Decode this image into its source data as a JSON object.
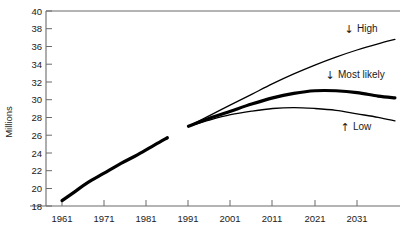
{
  "chart_data": {
    "type": "line",
    "title": "",
    "xlabel": "",
    "ylabel": "Millions",
    "xlim": [
      1961,
      2041
    ],
    "ylim": [
      18,
      40
    ],
    "ytick_step": 2,
    "grid": false,
    "legend_position": "inline-annotations",
    "xticks": [
      "1961",
      "1971",
      "1981",
      "1991",
      "2001",
      "2011",
      "2021",
      "2031"
    ],
    "yticks": [
      "18",
      "20",
      "22",
      "24",
      "26",
      "28",
      "30",
      "32",
      "34",
      "36",
      "38",
      "40"
    ],
    "series": [
      {
        "name": "Historical",
        "style": "thick",
        "annotation": "",
        "x": [
          1961,
          1964,
          1967,
          1971,
          1975,
          1979,
          1983,
          1986
        ],
        "values": [
          18.6,
          19.6,
          20.6,
          21.7,
          22.8,
          23.8,
          24.9,
          25.7
        ]
      },
      {
        "name": "High",
        "style": "thin",
        "annotation": "High",
        "annotation_arrow": "down-arrow",
        "x": [
          1991,
          1996,
          2001,
          2006,
          2011,
          2016,
          2021,
          2026,
          2031,
          2036,
          2040
        ],
        "values": [
          27.0,
          28.2,
          29.4,
          30.6,
          31.8,
          32.9,
          33.9,
          34.8,
          35.6,
          36.3,
          36.8
        ]
      },
      {
        "name": "Most likely",
        "style": "thick",
        "annotation": "Most likely",
        "annotation_arrow": "down-arrow",
        "x": [
          1991,
          1996,
          2001,
          2006,
          2011,
          2016,
          2021,
          2026,
          2031,
          2036,
          2040
        ],
        "values": [
          27.0,
          27.9,
          28.7,
          29.5,
          30.2,
          30.7,
          31.0,
          31.0,
          30.8,
          30.4,
          30.2
        ]
      },
      {
        "name": "Low",
        "style": "thin",
        "annotation": "Low",
        "annotation_arrow": "up-arrow",
        "x": [
          1991,
          1996,
          2001,
          2006,
          2011,
          2016,
          2021,
          2026,
          2031,
          2036,
          2040
        ],
        "values": [
          27.0,
          27.7,
          28.3,
          28.7,
          29.0,
          29.1,
          29.0,
          28.8,
          28.4,
          28.0,
          27.6
        ]
      }
    ],
    "annotations": [
      {
        "label": "High",
        "arrow": "↓"
      },
      {
        "label": "Most likely",
        "arrow": "↓"
      },
      {
        "label": "Low",
        "arrow": "↑"
      }
    ],
    "colors": {
      "line": "#000000",
      "axis": "#6b6b6b",
      "text": "#1a1a1a",
      "background": "#ffffff"
    }
  },
  "axes": {
    "y_axis_title": "Millions",
    "y_tick_labels": [
      "40",
      "38",
      "36",
      "34",
      "32",
      "30",
      "28",
      "26",
      "24",
      "22",
      "20",
      "18"
    ],
    "x_tick_labels": [
      "1961",
      "1971",
      "1981",
      "1991",
      "2001",
      "2011",
      "2021",
      "2031"
    ]
  },
  "annotations": {
    "high": {
      "arrow": "↓",
      "label": "High"
    },
    "most_likely": {
      "arrow": "↓",
      "label": "Most likely"
    },
    "low": {
      "arrow": "↑",
      "label": "Low"
    }
  }
}
